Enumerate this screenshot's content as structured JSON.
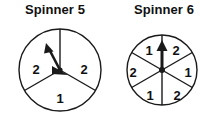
{
  "page": {
    "background_color": "#ffffff",
    "stroke_color": "#1a1a1a",
    "label_color": "#101010"
  },
  "spinners": [
    {
      "id": "spinner-5",
      "title": "Spinner 5",
      "sector_count": 3,
      "sectors": [
        {
          "position": "right",
          "label": "2",
          "start_angle_deg": 330,
          "end_angle_deg": 90
        },
        {
          "position": "bottom",
          "label": "1",
          "start_angle_deg": 210,
          "end_angle_deg": 330
        },
        {
          "position": "left",
          "label": "2",
          "start_angle_deg": 90,
          "end_angle_deg": 210
        }
      ],
      "labels": [
        {
          "text": "2",
          "x": 36,
          "y": 51
        },
        {
          "text": "2",
          "x": 84,
          "y": 51
        },
        {
          "text": "1",
          "x": 60,
          "y": 80
        }
      ],
      "circle": {
        "cx": 60,
        "cy": 50,
        "r": 41
      },
      "arrow": {
        "pivot_x": 60,
        "pivot_y": 50,
        "tip_x": 47,
        "tip_y": 25,
        "direction": "up-left"
      }
    },
    {
      "id": "spinner-6",
      "title": "Spinner 6",
      "sector_count": 6,
      "sectors": [
        {
          "position": "upper-right",
          "label": "2",
          "start_angle_deg": 30,
          "end_angle_deg": 90
        },
        {
          "position": "right",
          "label": "1",
          "start_angle_deg": 330,
          "end_angle_deg": 30
        },
        {
          "position": "lower-right",
          "label": "2",
          "start_angle_deg": 270,
          "end_angle_deg": 330
        },
        {
          "position": "lower-left",
          "label": "1",
          "start_angle_deg": 210,
          "end_angle_deg": 270
        },
        {
          "position": "left",
          "label": "2",
          "start_angle_deg": 150,
          "end_angle_deg": 210
        },
        {
          "position": "upper-left",
          "label": "1",
          "start_angle_deg": 90,
          "end_angle_deg": 150
        }
      ],
      "labels": [
        {
          "text": "1",
          "x": 40,
          "y": 32
        },
        {
          "text": "2",
          "x": 67,
          "y": 32
        },
        {
          "text": "2",
          "x": 24,
          "y": 54
        },
        {
          "text": "1",
          "x": 79,
          "y": 54
        },
        {
          "text": "1",
          "x": 41,
          "y": 77
        },
        {
          "text": "2",
          "x": 68,
          "y": 77
        }
      ],
      "circle": {
        "cx": 53,
        "cy": 50,
        "r": 35
      },
      "arrow": {
        "pivot_x": 53,
        "pivot_y": 50,
        "tip_x": 53,
        "tip_y": 22,
        "direction": "up"
      }
    }
  ]
}
